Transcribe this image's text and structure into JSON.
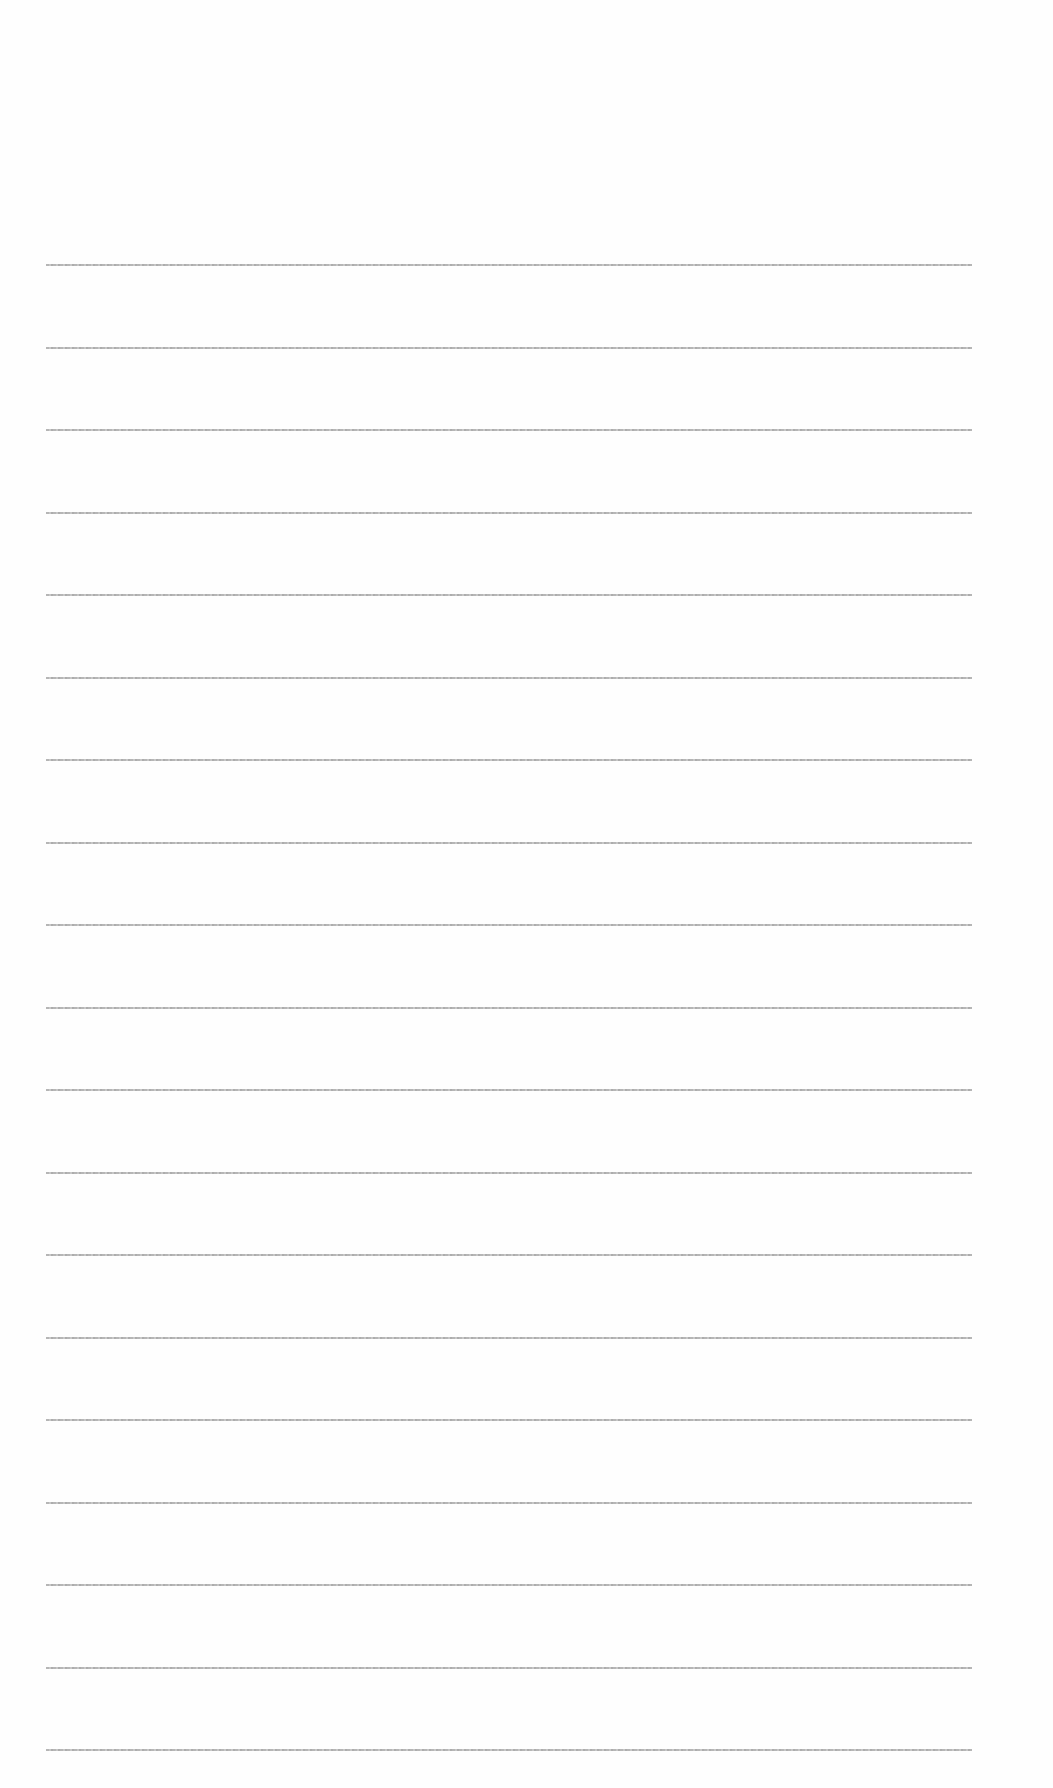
{
  "page": {
    "type": "lined-paper",
    "background_color": "#fefefe",
    "rule_color": "#a9a9a9",
    "rule_count": 19,
    "first_rule_y": 264,
    "rule_spacing": 82.5,
    "rule_left": 46,
    "rule_width": 926
  }
}
